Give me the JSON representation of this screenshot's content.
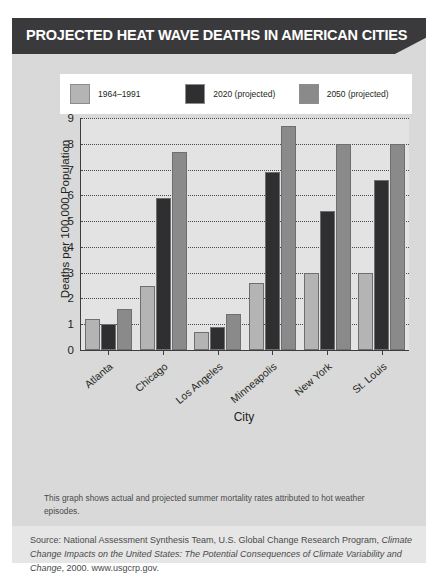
{
  "banner": {
    "title": "PROJECTED HEAT WAVE DEATHS IN AMERICAN CITIES",
    "background": "#3a3a3c",
    "text_color": "#ffffff"
  },
  "caption": "This graph shows actual and projected summer mortality rates attributed to hot weather episodes.",
  "source": {
    "lead": "Source: National Assessment Synthesis Team, U.S. Global Change Research Program,",
    "italic_title": "Climate Change Impacts on the United States: The Potential Consequences of Climate Variability and Change",
    "tail": ", 2000. www.usgcrp.gov."
  },
  "chart_data": {
    "type": "bar",
    "title": "PROJECTED HEAT WAVE DEATHS IN AMERICAN CITIES",
    "xlabel": "City",
    "ylabel": "Deaths per 100,000 Population",
    "ylim": [
      0,
      9
    ],
    "yticks": [
      9,
      8,
      7,
      6,
      5,
      4,
      3,
      2,
      1,
      0
    ],
    "grid": true,
    "legend_position": "top",
    "categories": [
      "Atlanta",
      "Chicago",
      "Los Angeles",
      "Minneapolis",
      "New York",
      "St. Louis"
    ],
    "series": [
      {
        "name": "1964–1991",
        "color": "#b4b4b4",
        "values": [
          1.2,
          2.5,
          0.7,
          2.6,
          3.0,
          3.0
        ]
      },
      {
        "name": "2020 (projected)",
        "color": "#2f2f31",
        "values": [
          1.0,
          5.9,
          0.9,
          6.9,
          5.4,
          6.6
        ]
      },
      {
        "name": "2050 (projected)",
        "color": "#8a8a8a",
        "values": [
          1.6,
          7.7,
          1.4,
          8.7,
          8.0,
          8.0
        ]
      }
    ]
  }
}
